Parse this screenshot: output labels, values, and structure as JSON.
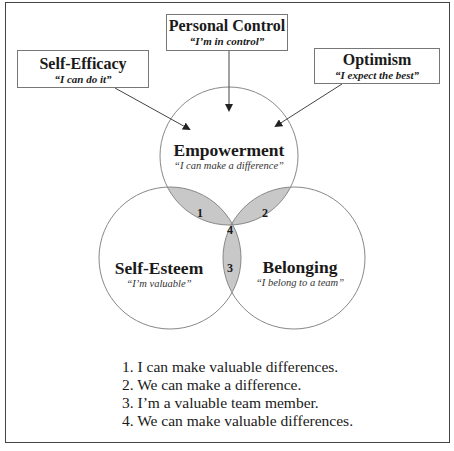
{
  "diagram": {
    "boxes": {
      "personal_control": {
        "title": "Personal Control",
        "quote": "“I’m in control”"
      },
      "self_efficacy": {
        "title": "Self-Efficacy",
        "quote": "“I can do it”"
      },
      "optimism": {
        "title": "Optimism",
        "quote": "“I expect the best”"
      }
    },
    "circles": {
      "empowerment": {
        "title": "Empowerment",
        "quote": "“I can make a difference”"
      },
      "self_esteem": {
        "title": "Self-Esteem",
        "quote": "“I’m valuable”"
      },
      "belonging": {
        "title": "Belonging",
        "quote": "“I belong to a team”"
      }
    },
    "intersections": [
      "1",
      "2",
      "3",
      "4"
    ],
    "legend": [
      "1. I can make valuable differences.",
      "2. We can make a difference.",
      "3. I’m a valuable team member.",
      "4. We can make valuable differences."
    ],
    "colors": {
      "overlap_fill": "#c8c8c8",
      "center_fill": "#a9a9a9",
      "circle_stroke": "#888888"
    }
  }
}
